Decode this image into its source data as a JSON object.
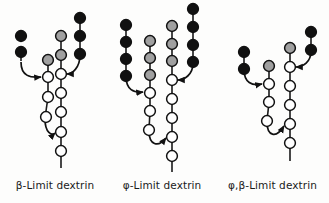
{
  "figure": {
    "background_color": "#fdfdfc",
    "node_colors": {
      "black": "#111111",
      "gray": "#a0a0a0",
      "white": "#ffffff",
      "outline": "#111111",
      "bond": "#1a1a1a"
    },
    "legend_meaning": {
      "black": "non-reducing-end glucose residue",
      "gray": "internal glucose residue",
      "white": "glucose residue of the dextrin backbone",
      "arrow": "alpha-1,6 branch linkage"
    }
  },
  "panels": [
    {
      "id": "beta-limit-dextrin",
      "caption": "β-Limit dextrin",
      "chains": [
        {
          "name": "left-outer-branch",
          "color": "black",
          "count": 2
        },
        {
          "name": "left-inner-stub",
          "color": "gray",
          "count": 1
        },
        {
          "name": "middle-branch",
          "color": "gray",
          "count": 2
        },
        {
          "name": "right-branch",
          "color": "black",
          "count": 3
        },
        {
          "name": "left-backbone",
          "color": "white",
          "count": 3
        },
        {
          "name": "main-backbone",
          "color": "white",
          "count": 6
        }
      ],
      "branch_arrows": 2
    },
    {
      "id": "phi-limit-dextrin",
      "caption": "φ-Limit dextrin",
      "chains": [
        {
          "name": "left-outer-branch",
          "color": "black",
          "count": 4
        },
        {
          "name": "left-inner-stub",
          "color": "gray",
          "count": 3
        },
        {
          "name": "middle-branch",
          "color": "gray",
          "count": 3
        },
        {
          "name": "right-branch",
          "color": "black",
          "count": 4
        },
        {
          "name": "left-backbone",
          "color": "white",
          "count": 3
        },
        {
          "name": "main-backbone",
          "color": "white",
          "count": 6
        }
      ],
      "branch_arrows": 2
    },
    {
      "id": "phi-beta-limit-dextrin",
      "caption": "φ,β-Limit dextrin",
      "chains": [
        {
          "name": "left-outer-branch",
          "color": "black",
          "count": 2
        },
        {
          "name": "left-inner-stub",
          "color": "gray",
          "count": 1
        },
        {
          "name": "middle-branch",
          "color": "gray",
          "count": 1
        },
        {
          "name": "right-branch",
          "color": "black",
          "count": 2
        },
        {
          "name": "left-backbone",
          "color": "white",
          "count": 3
        },
        {
          "name": "main-backbone",
          "color": "white",
          "count": 6
        }
      ],
      "branch_arrows": 2
    }
  ]
}
